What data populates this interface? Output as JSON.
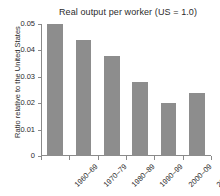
{
  "chart_data": {
    "type": "bar",
    "title": "Real output per worker (US = 1.0)",
    "xlabel": "",
    "ylabel": "Ratio relative to the United States",
    "categories": [
      "1960–69",
      "1970–79",
      "1980–89",
      "1990–99",
      "2000–09",
      "2010–17"
    ],
    "values": [
      0.05,
      0.044,
      0.038,
      0.028,
      0.02,
      0.024
    ],
    "ylim": [
      0,
      0.05
    ],
    "yticks": [
      0,
      0.01,
      0.02,
      0.03,
      0.04,
      0.05
    ],
    "ytick_labels": [
      "0",
      "0.01",
      "0.02",
      "0.03",
      "0.04",
      "0.05"
    ],
    "grid": false,
    "legend": false,
    "bar_color": "#8d8d8d",
    "axis_color": "#8a8a8a",
    "text_color": "#2b2b2b"
  }
}
